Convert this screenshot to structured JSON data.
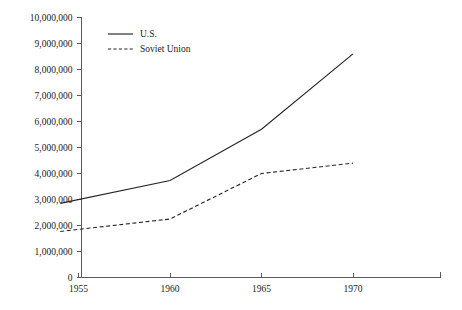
{
  "chart_data": {
    "type": "line",
    "title": "",
    "subtitle": "",
    "xlabel": "",
    "ylabel": "",
    "x": [
      1954,
      1960,
      1965,
      1970
    ],
    "xlim": [
      1953,
      1972.5
    ],
    "ylim": [
      0,
      10000000
    ],
    "grid": false,
    "legend_position": "top-left",
    "x_ticks": [
      1955,
      1960,
      1965,
      1970
    ],
    "x_tick_labels": [
      "1955",
      "1960",
      "1965",
      "1970"
    ],
    "y_ticks": [
      0,
      1000000,
      2000000,
      3000000,
      4000000,
      5000000,
      6000000,
      7000000,
      8000000,
      9000000,
      10000000
    ],
    "y_tick_labels": [
      "0",
      "1,000,000",
      "2,000,000",
      "3,000,000",
      "4,000,000",
      "5,000,000",
      "6,000,000",
      "7,000,000",
      "8,000,000",
      "9,000,000",
      "10,000,000"
    ],
    "series": [
      {
        "name": "U.S.",
        "style": "solid",
        "color": "#262626",
        "values": [
          2850000,
          3730000,
          5700000,
          8600000
        ]
      },
      {
        "name": "Soviet Union",
        "style": "dashed",
        "color": "#262626",
        "values": [
          1770000,
          2250000,
          4000000,
          4400000
        ]
      }
    ]
  },
  "legend": {
    "items": [
      {
        "label": "U.S.",
        "style": "solid"
      },
      {
        "label": "Soviet Union",
        "style": "dashed"
      }
    ]
  },
  "axes": {
    "axis_color": "#5a5a5a"
  }
}
